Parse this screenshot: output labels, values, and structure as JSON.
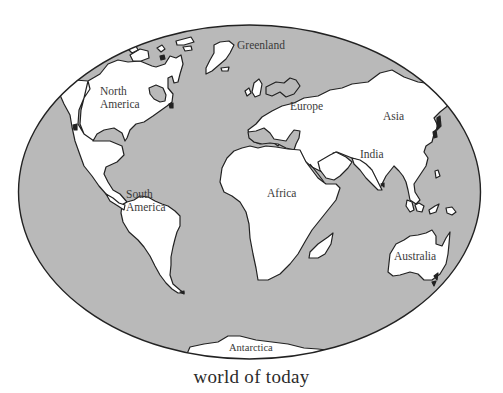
{
  "map": {
    "title": "world of today",
    "projection": "oval world map",
    "colors": {
      "ocean": "#b9b9b9",
      "land": "#ffffff",
      "outline": "#222222",
      "background": "#ffffff"
    },
    "labels": {
      "greenland": "Greenland",
      "north_america_1": "North",
      "north_america_2": "America",
      "europe": "Europe",
      "asia": "Asia",
      "india": "India",
      "africa": "Africa",
      "south_america_1": "South",
      "south_america_2": "America",
      "australia": "Australia",
      "antarctica": "Antarctica"
    }
  }
}
